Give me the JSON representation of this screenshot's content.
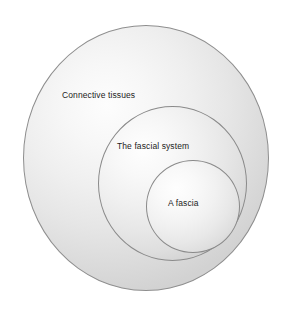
{
  "diagram": {
    "type": "nested-circles",
    "background_color": "#ffffff",
    "outline_color": "#8e8e8e",
    "label_color": "#1c1c1c",
    "levels": [
      {
        "id": "outer",
        "label": "Connective tissues",
        "role": "outermost containing set"
      },
      {
        "id": "middle",
        "label": "The fascial system",
        "role": "subset of connective tissues"
      },
      {
        "id": "inner",
        "label": "A fascia",
        "role": "subset of the fascial system"
      }
    ]
  }
}
